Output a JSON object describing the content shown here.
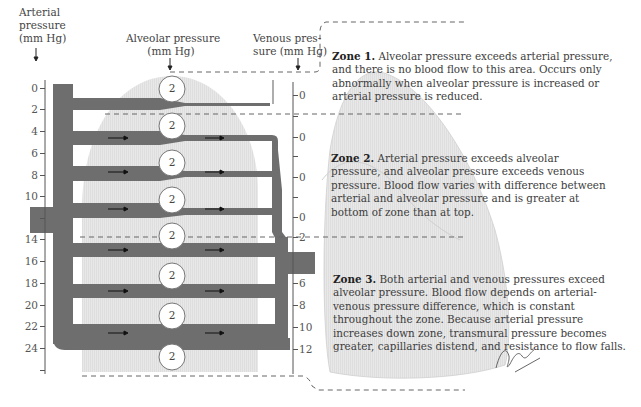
{
  "headers": {
    "arterial": [
      "Arterial",
      "pressure",
      "(mm Hg)"
    ],
    "alveolar": [
      "Alveolar pressure",
      "(mm Hg)"
    ],
    "venous": [
      "Venous pres-",
      "sure (mm Hg)"
    ]
  },
  "arterial_axis": {
    "ticks": [
      {
        "label": "0",
        "y": 88
      },
      {
        "label": "2",
        "y": 109
      },
      {
        "label": "4",
        "y": 131
      },
      {
        "label": "6",
        "y": 153
      },
      {
        "label": "8",
        "y": 175
      },
      {
        "label": "10",
        "y": 196
      },
      {
        "label": "",
        "y": 218
      },
      {
        "label": "14",
        "y": 239
      },
      {
        "label": "16",
        "y": 261
      },
      {
        "label": "18",
        "y": 283
      },
      {
        "label": "20",
        "y": 305
      },
      {
        "label": "22",
        "y": 326
      },
      {
        "label": "24",
        "y": 348
      },
      {
        "label": "",
        "y": 370
      }
    ]
  },
  "venous_axis": {
    "ticks": [
      {
        "label": "0",
        "y": 95
      },
      {
        "label": "",
        "y": 116
      },
      {
        "label": "0",
        "y": 137
      },
      {
        "label": "",
        "y": 156
      },
      {
        "label": "0",
        "y": 177
      },
      {
        "label": "",
        "y": 197
      },
      {
        "label": "0",
        "y": 217
      },
      {
        "label": "2",
        "y": 237
      },
      {
        "label": "6",
        "y": 283
      },
      {
        "label": "8",
        "y": 305
      },
      {
        "label": "10",
        "y": 327
      },
      {
        "label": "12",
        "y": 349
      }
    ]
  },
  "alveoli": {
    "value": "2",
    "ys": [
      89,
      126,
      163,
      200,
      236,
      276,
      316,
      357
    ]
  },
  "zones": [
    {
      "title": "Zone 1.",
      "text": " Alveolar pressure exceeds arterial pressure, and there is no blood flow to this area. Occurs only abnormally when alveolar pressure is increased or arterial pressure is reduced."
    },
    {
      "title": "Zone 2.",
      "text": " Arterial pressure exceeds alveolar pressure, and alveolar pressure exceeds venous pressure. Blood flow varies with difference between arterial and alveolar pressure and is greater at bottom of zone than at top."
    },
    {
      "title": "Zone 3.",
      "text": " Both arterial and venous pressures exceed alveolar pressure. Blood flow depends on arterial-venous pressure difference, which is constant throughout the zone. Because arterial pressure increases down zone, transmural pressure becomes greater, capillaries distend, and resistance to flow falls."
    }
  ],
  "signature": "F. Netter M.D.",
  "colors": {
    "vessel": "#6e6e6e",
    "lung": "#e6e6e6",
    "lung_edge": "#d2d2d2",
    "dash": "#666666",
    "axis": "#555555"
  }
}
